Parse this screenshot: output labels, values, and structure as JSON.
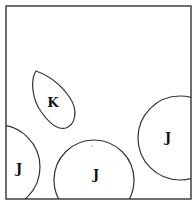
{
  "diagram": {
    "frame": {
      "x": 6,
      "y": 6,
      "width": 185,
      "height": 193,
      "stroke": "#333333"
    },
    "shapes": [
      {
        "id": "leaf-k",
        "type": "leaf",
        "label": "K",
        "label_x": 53,
        "label_y": 107
      },
      {
        "id": "circle-left",
        "type": "circle",
        "label": "J",
        "cx": -2,
        "cy": 167,
        "r": 42,
        "label_x": 19,
        "label_y": 173
      },
      {
        "id": "circle-middle",
        "type": "circle",
        "label": "J",
        "cx": 94,
        "cy": 180,
        "r": 40,
        "label_x": 96,
        "label_y": 179
      },
      {
        "id": "circle-right",
        "type": "circle",
        "label": "J",
        "cx": 180,
        "cy": 138,
        "r": 42,
        "label_x": 168,
        "label_y": 142
      }
    ]
  }
}
